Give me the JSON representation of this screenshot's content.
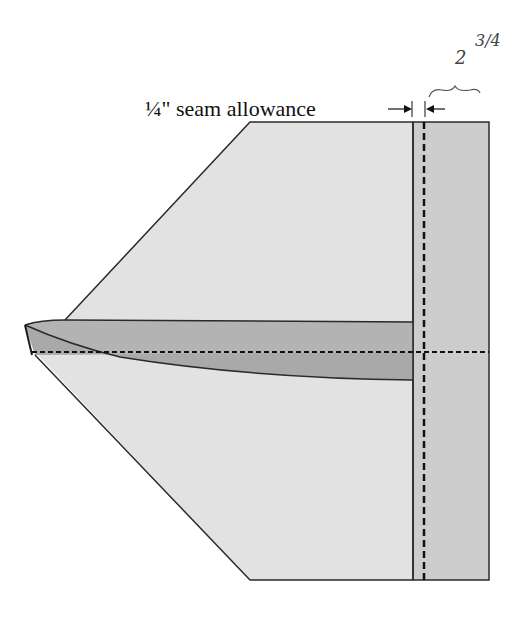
{
  "diagram": {
    "label": "¼\" seam allowance",
    "handwritten_whole": "2",
    "handwritten_fraction": "3/4",
    "colors": {
      "light_fabric": "#e2e2e2",
      "mid_fabric": "#c9c9c9",
      "dark_fabric": "#b3b3b3",
      "outline": "#2a2a2a",
      "stitch": "#111111"
    }
  }
}
